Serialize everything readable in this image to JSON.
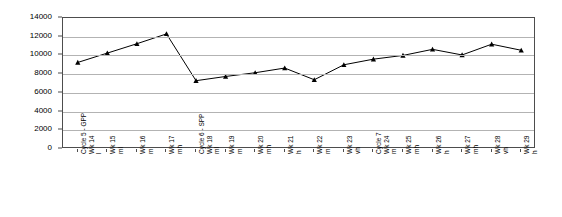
{
  "chart_data": {
    "type": "line",
    "title": "",
    "subtitle": "",
    "xlabel": "",
    "ylabel": "",
    "ylim": [
      0,
      14000
    ],
    "ytick_step": 2000,
    "yticks": [
      0,
      2000,
      4000,
      6000,
      8000,
      10000,
      12000,
      14000
    ],
    "ytick_labels": [
      "0",
      "2000",
      "4000",
      "6000",
      "8000",
      "10000",
      "12000",
      "14000"
    ],
    "grid": true,
    "legend": false,
    "legend_position": "none",
    "marker": "triangle",
    "line_color": "#000000",
    "marker_color": "#000000",
    "categories": [
      "l\nWk 14\nCycle 5 - GPP",
      "ml\nWk 15",
      "m\nWk 16",
      "mh\nWk 17",
      "ml\nWk 18\nCycle 6 - SPP",
      "m\nWk 19",
      "mh\nWk 20",
      "h\nWk 21",
      "m\nWk 22",
      "vh\nWk 23",
      "m\nWk 24\nCycle 7",
      "mh\nWk 25",
      "h\nWk 26",
      "mh\nWk 27",
      "vh\nWk 28",
      "h\nWk 29"
    ],
    "category_lines": [
      [
        "l",
        "Wk 14",
        "Cycle 5 - GPP"
      ],
      [
        "ml",
        "Wk 15"
      ],
      [
        "m",
        "Wk 16"
      ],
      [
        "mh",
        "Wk 17"
      ],
      [
        "ml",
        "Wk 18",
        "Cycle 6 - SPP"
      ],
      [
        "m",
        "Wk 19"
      ],
      [
        "mh",
        "Wk 20"
      ],
      [
        "h",
        "Wk 21"
      ],
      [
        "m",
        "Wk 22"
      ],
      [
        "vh",
        "Wk 23"
      ],
      [
        "m",
        "Wk 24",
        "Cycle 7"
      ],
      [
        "mh",
        "Wk 25"
      ],
      [
        "h",
        "Wk 26"
      ],
      [
        "mh",
        "Wk 27"
      ],
      [
        "vh",
        "Wk 28"
      ],
      [
        "h",
        "Wk 29"
      ]
    ],
    "values": [
      9250,
      10250,
      11250,
      12300,
      7300,
      7750,
      8150,
      8650,
      7400,
      9000,
      9600,
      10000,
      10650,
      10050,
      11200,
      10550
    ]
  }
}
